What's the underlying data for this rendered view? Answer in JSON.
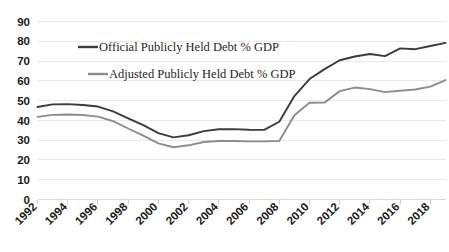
{
  "chart_data": {
    "type": "line",
    "title": "",
    "xlabel": "",
    "ylabel": "",
    "ylim": [
      0,
      90
    ],
    "ytick_step": 10,
    "yticks": [
      "0",
      "10",
      "20",
      "30",
      "40",
      "50",
      "60",
      "70",
      "80",
      "90"
    ],
    "grid": true,
    "legend_position": "inside-upper-left",
    "x": [
      1992,
      1993,
      1994,
      1995,
      1996,
      1997,
      1998,
      1999,
      2000,
      2001,
      2002,
      2003,
      2004,
      2005,
      2006,
      2007,
      2008,
      2009,
      2010,
      2011,
      2012,
      2013,
      2014,
      2015,
      2016,
      2017,
      2018,
      2019
    ],
    "xticks": [
      "1992",
      "1994",
      "1996",
      "1998",
      "2000",
      "2002",
      "2004",
      "2006",
      "2008",
      "2010",
      "2012",
      "2014",
      "2016",
      "2018"
    ],
    "series": [
      {
        "name": "Official Publicly Held Debt % GDP",
        "color": "#3b3b3b",
        "values": [
          46.8,
          48.1,
          48.2,
          47.8,
          47.0,
          44.6,
          41.0,
          37.6,
          33.6,
          31.4,
          32.5,
          34.6,
          35.5,
          35.6,
          35.3,
          35.2,
          39.3,
          52.3,
          60.9,
          65.9,
          70.4,
          72.3,
          73.6,
          72.5,
          76.4,
          76.0,
          77.6,
          79.2
        ]
      },
      {
        "name": "Adjusted Publicly Held Debt % GDP",
        "color": "#8c8c8c",
        "values": [
          41.8,
          42.8,
          43.0,
          42.7,
          41.9,
          39.6,
          35.9,
          32.3,
          28.4,
          26.4,
          27.4,
          29.1,
          29.6,
          29.6,
          29.4,
          29.4,
          29.6,
          42.6,
          48.9,
          49.0,
          54.8,
          56.6,
          55.8,
          54.3,
          55.0,
          55.6,
          57.1,
          60.4
        ]
      }
    ],
    "legend": [
      {
        "label": "Official Publicly Held Debt % GDP",
        "color": "#3b3b3b"
      },
      {
        "label": "Adjusted Publicly Held Debt % GDP",
        "color": "#8c8c8c"
      }
    ]
  }
}
